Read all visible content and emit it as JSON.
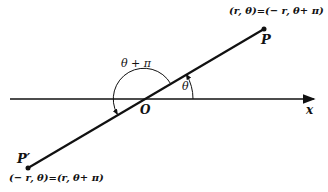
{
  "diagram": {
    "type": "polar-coordinates-negative-radius",
    "axis_label": "x",
    "origin_label": "O",
    "point_p": {
      "label": "P",
      "coords": "(r, θ)=(− r, θ+ π)"
    },
    "point_p_prime": {
      "label": "P′",
      "coords": "(− r, θ)=(r, θ+ π)"
    },
    "angle_small_label": "θ",
    "angle_large_label": "θ + π",
    "colors": {
      "line": "#111111",
      "background": "#ffffff"
    }
  }
}
